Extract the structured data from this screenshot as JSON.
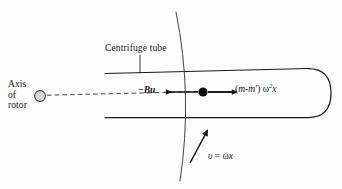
{
  "figure": {
    "background_color": "#fdfdfd",
    "line_color": "#1a1a1a",
    "width": 342,
    "height": 189
  },
  "labels": {
    "centrifuge_tube": "Centrifuge tube",
    "axis_line1": "Axis",
    "axis_line2": "of",
    "axis_line3": "rotor",
    "force_drag": "−Bu",
    "force_drag_text": "−Bu",
    "force_centrifugal_lead": "(",
    "force_centrifugal_m": "m",
    "force_centrifugal_minus": "-",
    "force_centrifugal_mprime": "m'",
    "force_centrifugal_close": ")",
    "force_centrifugal_omega": "ω",
    "force_centrifugal_exp": "2",
    "force_centrifugal_x": "x",
    "velocity_symbol": "υ",
    "velocity_equals": "=",
    "velocity_omega": "ω",
    "velocity_x": "x"
  },
  "elements": {
    "rotor_axis_marker": "hatched-circle",
    "tube_shape": "rounded-right-end-tube",
    "rotation_arc": "circular-arc-through-particle",
    "particle": "filled-black-dot",
    "drag_arrow_direction": "left",
    "centrifugal_arrow_direction": "right",
    "velocity_arrow_direction": "up-right-tangent",
    "leader_line": "centrifuge-tube-to-upper-wall",
    "axis_dashed_line": "rotor-axis-to-tube"
  },
  "geometry": {
    "rotor_axis_x": 40,
    "rotor_axis_y": 96,
    "particle_x": 203,
    "particle_y": 92,
    "tube_left_x": 105,
    "tube_right_x": 330,
    "tube_top_y": 68,
    "tube_bottom_y": 118
  }
}
